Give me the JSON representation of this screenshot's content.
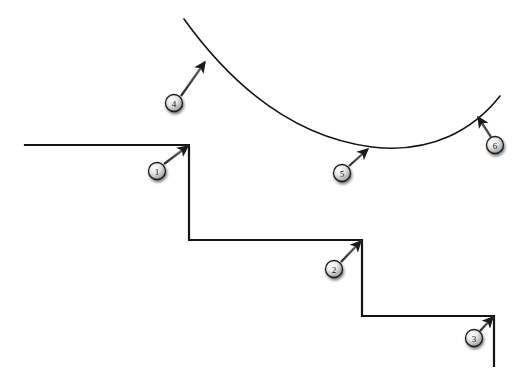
{
  "figure": {
    "background_color": "#ffffff",
    "stroke_color": "#141414",
    "width": 523,
    "height": 389
  },
  "chart_data": {
    "type": "line",
    "xlabel": "",
    "ylabel": "",
    "grid": false,
    "legend": "none",
    "xlim": [
      0,
      523
    ],
    "ylim": [
      389,
      0
    ],
    "series": [
      {
        "name": "step-function",
        "type": "step",
        "stroke": "#141414",
        "stroke_width": 2.2,
        "points": [
          [
            25,
            145
          ],
          [
            189,
            145
          ],
          [
            189,
            240
          ],
          [
            362,
            240
          ],
          [
            362,
            316
          ],
          [
            494,
            316
          ],
          [
            494,
            366
          ]
        ]
      },
      {
        "name": "smooth-curve",
        "type": "curve",
        "stroke": "#141414",
        "stroke_width": 1.6,
        "path": "M 184 19 C 225 76, 286 136, 372 147 C 432 154, 474 129, 500 96",
        "points": [
          [
            184,
            19
          ],
          [
            230,
            72
          ],
          [
            280,
            116
          ],
          [
            330,
            140
          ],
          [
            372,
            147
          ],
          [
            420,
            143
          ],
          [
            460,
            124
          ],
          [
            500,
            96
          ]
        ],
        "minimum_point": [
          372,
          147
        ]
      }
    ]
  },
  "callouts": [
    {
      "label": "1",
      "circle": {
        "cx": 157,
        "cy": 171,
        "r": 8.5
      },
      "arrow": {
        "x1": 164,
        "y1": 164,
        "x2": 188,
        "y2": 146
      },
      "target": "step-corner-1"
    },
    {
      "label": "2",
      "circle": {
        "cx": 334,
        "cy": 269,
        "r": 8.5
      },
      "arrow": {
        "x1": 341,
        "y1": 262,
        "x2": 361,
        "y2": 241
      },
      "target": "step-corner-2"
    },
    {
      "label": "3",
      "circle": {
        "cx": 474,
        "cy": 338,
        "r": 8.5
      },
      "arrow": {
        "x1": 480,
        "y1": 331,
        "x2": 493,
        "y2": 317
      },
      "target": "step-corner-3"
    },
    {
      "label": "4",
      "circle": {
        "cx": 174,
        "cy": 103,
        "r": 8.5
      },
      "arrow": {
        "x1": 181,
        "y1": 96,
        "x2": 205,
        "y2": 62
      },
      "target": "curve-upper-left"
    },
    {
      "label": "5",
      "circle": {
        "cx": 342,
        "cy": 173,
        "r": 8.5
      },
      "arrow": {
        "x1": 349,
        "y1": 166,
        "x2": 368,
        "y2": 149
      },
      "target": "curve-minimum"
    },
    {
      "label": "6",
      "circle": {
        "cx": 495,
        "cy": 145,
        "r": 8.5
      },
      "arrow": {
        "x1": 491,
        "y1": 137,
        "x2": 478,
        "y2": 117
      },
      "target": "curve-upper-right"
    }
  ],
  "colors": {
    "ink": "#141414",
    "callout_fill_light": "#f2f2f2",
    "callout_fill_dark": "#9a9a9a",
    "callout_border": "#1a1a1a",
    "shadow": "#8c8c8c"
  }
}
